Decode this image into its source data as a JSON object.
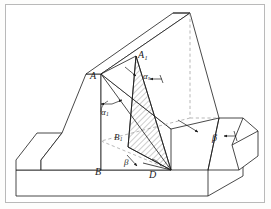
{
  "figure": {
    "background_color": "#ffffff",
    "frame_color": "#b9b9b9",
    "line_color": "#1b1b1b",
    "hidden_line_color": "#9a9a9a",
    "hatch_color": "#555555"
  },
  "labels": {
    "point_a": {
      "text": "A",
      "sub": "",
      "x": 90,
      "y": 71
    },
    "point_a1": {
      "text": "A",
      "sub": "1",
      "x": 138,
      "y": 50
    },
    "point_b": {
      "text": "B",
      "sub": "",
      "x": 95,
      "y": 167
    },
    "point_b1": {
      "text": "B",
      "sub": "1",
      "x": 114,
      "y": 133
    },
    "point_d": {
      "text": "D",
      "sub": "",
      "x": 149,
      "y": 170
    },
    "angle_alpha_1": {
      "text": "α",
      "sub": "1",
      "x": 101,
      "y": 108
    },
    "angle_alpha_s": {
      "text": "α",
      "sub": "s",
      "x": 143,
      "y": 72
    },
    "angle_beta_bottom": {
      "text": "β",
      "sub": "",
      "x": 124,
      "y": 158
    },
    "angle_beta_right": {
      "text": "β",
      "sub": "",
      "x": 212,
      "y": 133
    }
  },
  "annotations": {
    "leader_alpha_s": "arrow-to-wedge-upper",
    "leader_alpha_1": "arrow-to-slope-face",
    "leader_beta_right": "arrow-to-right-slope",
    "leader_beta_bottom": "arrow-to-base-angle"
  },
  "geometry": {
    "description": "Isometric embankment with hatched sliding wedge A1-B1-D",
    "base_slab": "horizontal ground slab",
    "left_wing": "low parallelogram shoulder at left",
    "right_wing": "low prism shoulder at right",
    "wedge": "hatched narrow triangular failure surface"
  }
}
